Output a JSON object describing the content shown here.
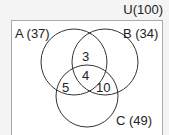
{
  "universe": {
    "label": "U(100)"
  },
  "sets": [
    {
      "name": "A",
      "label": "A (37)",
      "cx": 74,
      "cy": 62,
      "r": 33
    },
    {
      "name": "B",
      "label": "B (34)",
      "cx": 105,
      "cy": 62,
      "r": 33
    },
    {
      "name": "C",
      "label": "C (49)",
      "cx": 87,
      "cy": 96,
      "r": 31
    }
  ],
  "regions": {
    "a_and_b_only": "3",
    "a_b_c": "4",
    "a_and_c_only": "5",
    "b_and_c_only": "10"
  }
}
